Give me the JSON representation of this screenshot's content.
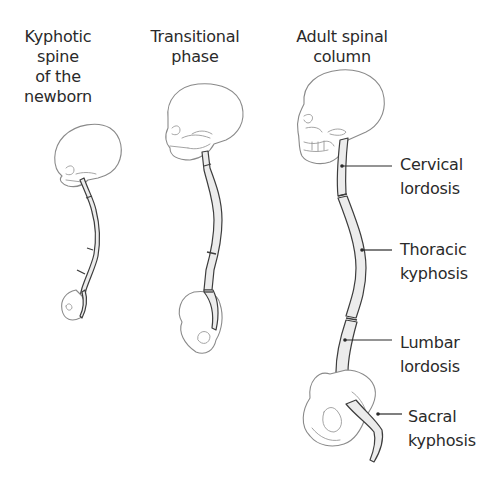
{
  "diagram": {
    "stages": [
      {
        "id": "newborn",
        "title_lines": [
          "Kyphotic",
          "spine",
          "of the",
          "newborn"
        ]
      },
      {
        "id": "transitional",
        "title_lines": [
          "Transitional",
          "phase"
        ]
      },
      {
        "id": "adult",
        "title_lines": [
          "Adult spinal",
          "column"
        ]
      }
    ],
    "regions": [
      {
        "id": "cervical",
        "lines": [
          "Cervical",
          "lordosis"
        ]
      },
      {
        "id": "thoracic",
        "lines": [
          "Thoracic",
          "kyphosis"
        ]
      },
      {
        "id": "lumbar",
        "lines": [
          "Lumbar",
          "lordosis"
        ]
      },
      {
        "id": "sacral",
        "lines": [
          "Sacral",
          "kyphosis"
        ]
      }
    ],
    "colors": {
      "text": "#2a2a2a",
      "bone_outline": "#8a8a8a",
      "spine_fill": "#ececec",
      "spine_stroke": "#3d3d3d"
    }
  }
}
